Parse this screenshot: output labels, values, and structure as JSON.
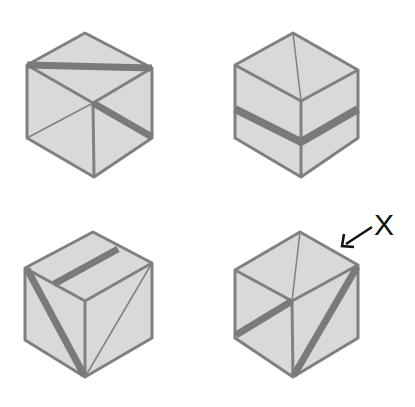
{
  "colors": {
    "background": "#ffffff",
    "face_fill": "#d9d9d9",
    "edge_stroke": "#808080",
    "band_stroke": "#7a7a7a",
    "label": "#111111"
  },
  "annotation": {
    "label": "X",
    "points_to": "cube-4 top-right edge"
  },
  "cubes": [
    {
      "id": "cube-1",
      "position": "top-left",
      "vertices": {
        "top": [
          85,
          33
        ],
        "left_top": [
          27,
          65
        ],
        "right_top": [
          152,
          68
        ],
        "center": [
          93,
          103
        ],
        "left_bottom": [
          27,
          138
        ],
        "right_bottom": [
          152,
          138
        ],
        "bottom": [
          94,
          177
        ]
      },
      "thin_lines": [
        [
          [
            27,
            138
          ],
          [
            93,
            103
          ]
        ]
      ],
      "thick_bands": [
        [
          [
            27,
            65
          ],
          [
            152,
            68
          ]
        ],
        [
          [
            93,
            103
          ],
          [
            152,
            138
          ]
        ]
      ]
    },
    {
      "id": "cube-2",
      "position": "top-right",
      "vertices": {
        "top": [
          293,
          33
        ],
        "left_top": [
          235,
          65
        ],
        "right_top": [
          358,
          70
        ],
        "center": [
          301,
          101
        ],
        "left_bottom": [
          235,
          138
        ],
        "right_bottom": [
          358,
          138
        ],
        "bottom": [
          301,
          177
        ]
      },
      "thin_lines": [
        [
          [
            293,
            33
          ],
          [
            301,
            101
          ]
        ]
      ],
      "thick_bands": [
        [
          [
            235,
            109
          ],
          [
            301,
            141
          ]
        ],
        [
          [
            301,
            141
          ],
          [
            358,
            109
          ]
        ]
      ]
    },
    {
      "id": "cube-3",
      "position": "bottom-left",
      "vertices": {
        "top": [
          93,
          232
        ],
        "left_top": [
          25,
          268
        ],
        "right_top": [
          152,
          263
        ],
        "center": [
          85,
          301
        ],
        "left_bottom": [
          25,
          340
        ],
        "right_bottom": [
          152,
          338
        ],
        "bottom": [
          85,
          377
        ]
      },
      "thin_lines": [
        [
          [
            152,
            263
          ],
          [
            85,
            377
          ]
        ]
      ],
      "thick_bands": [
        [
          [
            53,
            283
          ],
          [
            117,
            250
          ]
        ],
        [
          [
            25,
            268
          ],
          [
            85,
            377
          ]
        ]
      ]
    },
    {
      "id": "cube-4",
      "position": "bottom-right",
      "vertices": {
        "top": [
          300,
          232
        ],
        "left_top": [
          235,
          270
        ],
        "right_top": [
          358,
          265
        ],
        "center": [
          292,
          301
        ],
        "left_bottom": [
          235,
          338
        ],
        "right_bottom": [
          358,
          338
        ],
        "bottom": [
          293,
          377
        ]
      },
      "thin_lines": [
        [
          [
            300,
            232
          ],
          [
            292,
            301
          ]
        ]
      ],
      "thick_bands": [
        [
          [
            292,
            301
          ],
          [
            235,
            336
          ]
        ],
        [
          [
            358,
            265
          ],
          [
            293,
            377
          ]
        ]
      ]
    }
  ]
}
